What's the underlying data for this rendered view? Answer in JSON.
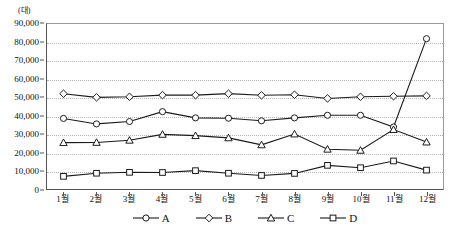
{
  "chart_data": {
    "type": "line",
    "title": "",
    "subtitle": "",
    "unit_label": "(대)",
    "xlabel": "",
    "ylabel": "",
    "ylim": [
      0,
      90000
    ],
    "y_ticks": [
      0,
      10000,
      20000,
      30000,
      40000,
      50000,
      60000,
      70000,
      80000,
      90000
    ],
    "y_tick_labels": [
      "0",
      "10,000",
      "20,000",
      "30,000",
      "40,000",
      "50,000",
      "60,000",
      "70,000",
      "80,000",
      "90,000"
    ],
    "grid": true,
    "grid_axis": "y",
    "legend_position": "bottom",
    "categories": [
      "1월",
      "2월",
      "3월",
      "4월",
      "5월",
      "6월",
      "7월",
      "8월",
      "9월",
      "10월",
      "11월",
      "12월"
    ],
    "series": [
      {
        "name": "A",
        "marker": "circle",
        "color": "#1a1a1a",
        "values": [
          38500,
          35500,
          36800,
          42200,
          38800,
          38600,
          37200,
          38800,
          40200,
          40200,
          33800,
          82000
        ]
      },
      {
        "name": "B",
        "marker": "diamond",
        "color": "#1a1a1a",
        "values": [
          52000,
          50000,
          50300,
          51200,
          51200,
          52000,
          51100,
          51400,
          49400,
          50300,
          50600,
          50800
        ]
      },
      {
        "name": "C",
        "marker": "triangle",
        "color": "#1a1a1a",
        "values": [
          25300,
          25400,
          26600,
          29800,
          29100,
          27900,
          24100,
          30000,
          21700,
          21100,
          32400,
          25600
        ]
      },
      {
        "name": "D",
        "marker": "square",
        "color": "#1a1a1a",
        "values": [
          6900,
          8600,
          9100,
          9000,
          10000,
          8600,
          7400,
          8500,
          12900,
          11600,
          15300,
          10300
        ]
      }
    ]
  }
}
